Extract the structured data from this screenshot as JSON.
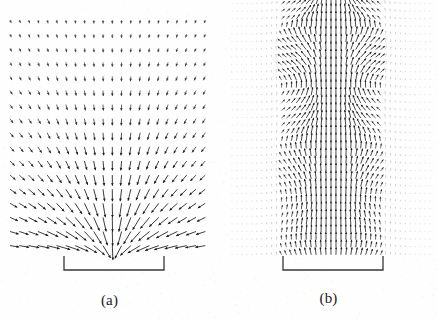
{
  "figure": {
    "background_color": "#fefefe",
    "ink_color": "#1a1a1a",
    "width": 438,
    "height": 319
  },
  "panels": [
    {
      "id": "a",
      "caption": "(a)",
      "plot_type": "quiver",
      "description": "Sparse vector field converging radially toward a focal region just above the aperture bracket",
      "field": {
        "origin_x": 10,
        "origin_y": 20,
        "cols": 22,
        "rows": 17,
        "dx": 9.3,
        "dy": 14.1,
        "baseline_y": 259,
        "focus_x": 113,
        "focus_y": 262,
        "arrow_scale": 11.5,
        "max_arrow": 14.5,
        "line_width": 0.85,
        "head_size": 2.6,
        "falloff": 105,
        "min_alpha": 0.22,
        "max_alpha": 1.0
      },
      "bracket": {
        "x1": 64,
        "x2": 164,
        "y": 270,
        "tick_height": 14,
        "line_width": 1.3
      }
    },
    {
      "id": "b",
      "caption": "(b)",
      "plot_type": "quiver",
      "description": "Dense vector field of near-vertical arrows with a dome-shaped intense core and crossing caustic structure above the aperture bracket",
      "field": {
        "origin_x": 232,
        "origin_y": 4,
        "cols": 41,
        "rows": 34,
        "dx": 4.95,
        "dy": 7.6,
        "baseline_y": 261,
        "center_x": 333,
        "aperture_half": 50,
        "arrow_scale": 7.2,
        "max_arrow": 8.2,
        "line_width": 0.8,
        "head_size": 2.0,
        "beam_half_width": 52,
        "core_half_width": 26,
        "dome_apex_y": 6,
        "dome_half_width": 44,
        "caustic_period": 58,
        "min_alpha": 0.1,
        "max_alpha": 1.0
      },
      "bracket": {
        "x1": 283,
        "x2": 383,
        "y": 270,
        "tick_height": 14,
        "line_width": 1.3
      }
    }
  ]
}
